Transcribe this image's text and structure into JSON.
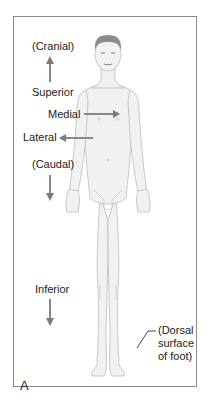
{
  "diagram": {
    "panel_letter": "A",
    "labels": {
      "cranial": "(Cranial)",
      "superior": "Superior",
      "medial": "Medial",
      "lateral": "Lateral",
      "caudal": "(Caudal)",
      "inferior": "Inferior",
      "dorsal_line1": "(Dorsal",
      "dorsal_line2": "surface",
      "dorsal_line3": "of foot)"
    },
    "arrows": [
      {
        "name": "superior-arrow",
        "direction": "up"
      },
      {
        "name": "medial-arrow",
        "direction": "right"
      },
      {
        "name": "lateral-arrow",
        "direction": "left"
      },
      {
        "name": "caudal-arrow",
        "direction": "down"
      },
      {
        "name": "inferior-arrow",
        "direction": "down"
      }
    ],
    "colors": {
      "arrow": "#7a7a7a",
      "border": "#8a8a8a",
      "skin": "#f1f1f1",
      "outline": "#b5b5b5",
      "hair": "#8c8c8c"
    }
  }
}
